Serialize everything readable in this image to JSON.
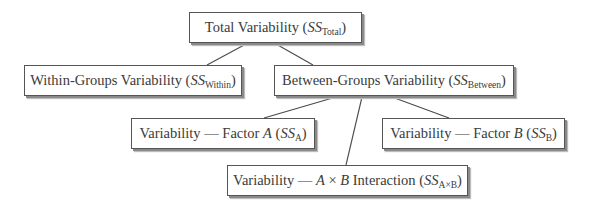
{
  "diagram": {
    "nodes": {
      "total": {
        "prefix": "Total Variability (",
        "ss": "SS",
        "sub": "Total",
        "suffix": ")"
      },
      "within": {
        "prefix": "Within-Groups Variability (",
        "ss": "SS",
        "sub": "Within",
        "suffix": ")"
      },
      "between": {
        "prefix": "Between-Groups Variability (",
        "ss": "SS",
        "sub": "Between",
        "suffix": ")"
      },
      "factor_a": {
        "prefix": "Variability — Factor ",
        "factor": "A",
        "mid": " (",
        "ss": "SS",
        "sub": "A",
        "suffix": ")"
      },
      "factor_b": {
        "prefix": "Variability — Factor ",
        "factor": "B",
        "mid": " (",
        "ss": "SS",
        "sub": "B",
        "suffix": ")"
      },
      "interaction": {
        "prefix": "Variability — ",
        "factor1": "A",
        "times": " × ",
        "factor2": "B",
        "mid": " Interaction (",
        "ss": "SS",
        "sub": "A×B",
        "suffix": ")"
      }
    },
    "edges": [
      {
        "from": "total",
        "to": "within"
      },
      {
        "from": "total",
        "to": "between"
      },
      {
        "from": "between",
        "to": "factor_a"
      },
      {
        "from": "between",
        "to": "interaction"
      },
      {
        "from": "between",
        "to": "factor_b"
      }
    ]
  }
}
